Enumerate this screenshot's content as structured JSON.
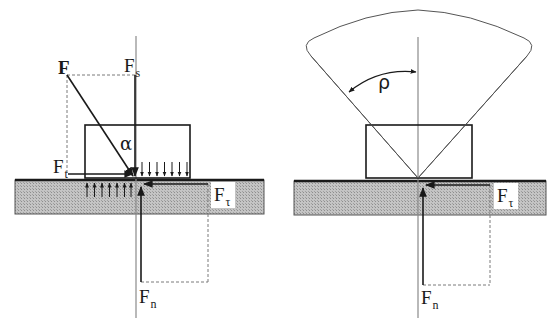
{
  "figure": {
    "colors": {
      "line": "#1a1a1a",
      "axis": "#8a8a8a",
      "dashed": "#7a7a7a",
      "ground_fill": "#b8b8b8",
      "ground_hatch": "#9a9a9a",
      "background": "#ffffff"
    }
  },
  "left_panel": {
    "labels": {
      "force": "F",
      "force_vertical_main": "F",
      "force_vertical_sub": "s",
      "force_horizontal_main": "F",
      "force_horizontal_sub": "t",
      "angle": "α",
      "friction_main": "F",
      "friction_sub": "τ",
      "normal_main": "F",
      "normal_sub": "n"
    },
    "pressure_arrows_down": 7,
    "pressure_arrows_up": 7
  },
  "right_panel": {
    "labels": {
      "cone_angle": "ρ",
      "friction_main": "F",
      "friction_sub": "τ",
      "normal_main": "F",
      "normal_sub": "n"
    }
  }
}
